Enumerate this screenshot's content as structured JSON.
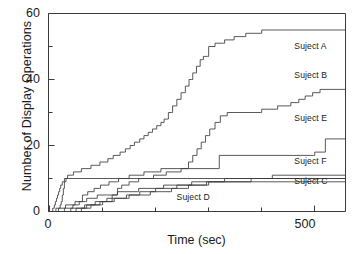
{
  "chart_data": {
    "type": "line",
    "title": "",
    "xlabel": "Time (sec)",
    "ylabel": "Number of Display Operations",
    "xlim": [
      0,
      560
    ],
    "ylim": [
      0,
      60
    ],
    "xticks": [
      0,
      500
    ],
    "xticklabels": [
      "0",
      "500"
    ],
    "xminorticks": [
      100,
      200,
      300,
      400
    ],
    "yticks": [
      0,
      20,
      40,
      60
    ],
    "yticklabels": [
      "0",
      "20",
      "40",
      "60"
    ],
    "yminorticks": [
      10,
      30,
      50
    ],
    "grid": false,
    "legend_position": "inline-right",
    "style": "step-post",
    "line_color": "#3b3b3b",
    "series": [
      {
        "name": "Suject A",
        "label_x": 505,
        "label_y": 50,
        "points": [
          [
            0,
            0
          ],
          [
            18,
            0
          ],
          [
            19,
            1
          ],
          [
            22,
            2
          ],
          [
            24,
            3
          ],
          [
            26,
            5
          ],
          [
            28,
            7
          ],
          [
            30,
            9
          ],
          [
            33,
            10
          ],
          [
            36,
            11
          ],
          [
            45,
            11
          ],
          [
            47,
            12
          ],
          [
            60,
            12
          ],
          [
            62,
            13
          ],
          [
            78,
            13
          ],
          [
            80,
            14
          ],
          [
            95,
            14
          ],
          [
            97,
            15
          ],
          [
            110,
            15
          ],
          [
            112,
            16
          ],
          [
            120,
            16
          ],
          [
            122,
            17
          ],
          [
            133,
            17
          ],
          [
            135,
            18
          ],
          [
            143,
            18
          ],
          [
            145,
            19
          ],
          [
            152,
            19
          ],
          [
            154,
            20
          ],
          [
            160,
            20
          ],
          [
            162,
            21
          ],
          [
            170,
            21
          ],
          [
            172,
            22
          ],
          [
            178,
            22
          ],
          [
            180,
            23
          ],
          [
            186,
            23
          ],
          [
            188,
            24
          ],
          [
            194,
            24
          ],
          [
            196,
            25
          ],
          [
            202,
            25
          ],
          [
            204,
            26
          ],
          [
            210,
            26
          ],
          [
            212,
            27
          ],
          [
            216,
            27
          ],
          [
            218,
            28
          ],
          [
            224,
            28
          ],
          [
            226,
            30
          ],
          [
            232,
            30
          ],
          [
            234,
            32
          ],
          [
            240,
            32
          ],
          [
            242,
            34
          ],
          [
            248,
            34
          ],
          [
            250,
            36
          ],
          [
            256,
            36
          ],
          [
            258,
            38
          ],
          [
            263,
            38
          ],
          [
            265,
            40
          ],
          [
            270,
            40
          ],
          [
            272,
            42
          ],
          [
            277,
            42
          ],
          [
            279,
            44
          ],
          [
            284,
            44
          ],
          [
            286,
            46
          ],
          [
            290,
            46
          ],
          [
            292,
            47
          ],
          [
            300,
            47
          ],
          [
            302,
            50
          ],
          [
            312,
            50
          ],
          [
            314,
            51
          ],
          [
            330,
            51
          ],
          [
            332,
            52
          ],
          [
            348,
            52
          ],
          [
            350,
            53
          ],
          [
            370,
            53
          ],
          [
            372,
            54
          ],
          [
            400,
            54
          ],
          [
            402,
            55
          ],
          [
            560,
            55
          ]
        ]
      },
      {
        "name": "Suject B",
        "label_x": 505,
        "label_y": 41,
        "points": [
          [
            0,
            0
          ],
          [
            40,
            0
          ],
          [
            42,
            1
          ],
          [
            70,
            1
          ],
          [
            72,
            2
          ],
          [
            95,
            2
          ],
          [
            97,
            3
          ],
          [
            118,
            3
          ],
          [
            120,
            5
          ],
          [
            128,
            5
          ],
          [
            130,
            7
          ],
          [
            136,
            7
          ],
          [
            138,
            8
          ],
          [
            150,
            8
          ],
          [
            152,
            9
          ],
          [
            168,
            9
          ],
          [
            170,
            10
          ],
          [
            196,
            10
          ],
          [
            198,
            11
          ],
          [
            220,
            11
          ],
          [
            222,
            12
          ],
          [
            248,
            12
          ],
          [
            250,
            13
          ],
          [
            262,
            13
          ],
          [
            264,
            15
          ],
          [
            270,
            15
          ],
          [
            272,
            17
          ],
          [
            278,
            17
          ],
          [
            280,
            19
          ],
          [
            286,
            19
          ],
          [
            288,
            21
          ],
          [
            294,
            21
          ],
          [
            296,
            23
          ],
          [
            302,
            23
          ],
          [
            304,
            25
          ],
          [
            312,
            25
          ],
          [
            314,
            27
          ],
          [
            322,
            27
          ],
          [
            324,
            29
          ],
          [
            335,
            29
          ],
          [
            337,
            30
          ],
          [
            400,
            30
          ],
          [
            402,
            31
          ],
          [
            430,
            31
          ],
          [
            432,
            32
          ],
          [
            455,
            32
          ],
          [
            457,
            33
          ],
          [
            470,
            33
          ],
          [
            472,
            34
          ],
          [
            482,
            34
          ],
          [
            484,
            35
          ],
          [
            496,
            35
          ],
          [
            498,
            36
          ],
          [
            510,
            36
          ],
          [
            512,
            37
          ],
          [
            560,
            37
          ]
        ]
      },
      {
        "name": "Suject E",
        "label_x": 505,
        "label_y": 28,
        "points": [
          [
            0,
            0
          ],
          [
            12,
            0
          ],
          [
            14,
            1
          ],
          [
            30,
            1
          ],
          [
            32,
            2
          ],
          [
            48,
            2
          ],
          [
            50,
            3
          ],
          [
            62,
            3
          ],
          [
            64,
            5
          ],
          [
            72,
            5
          ],
          [
            74,
            6
          ],
          [
            84,
            6
          ],
          [
            86,
            7
          ],
          [
            96,
            7
          ],
          [
            98,
            8
          ],
          [
            112,
            8
          ],
          [
            114,
            9
          ],
          [
            130,
            9
          ],
          [
            132,
            10
          ],
          [
            150,
            10
          ],
          [
            152,
            11
          ],
          [
            178,
            11
          ],
          [
            180,
            12
          ],
          [
            210,
            12
          ],
          [
            212,
            13
          ],
          [
            320,
            13
          ],
          [
            322,
            17
          ],
          [
            500,
            17
          ],
          [
            502,
            18
          ],
          [
            520,
            18
          ],
          [
            522,
            22
          ],
          [
            560,
            22
          ]
        ]
      },
      {
        "name": "Suject F",
        "label_x": 505,
        "label_y": 15,
        "points": [
          [
            0,
            0
          ],
          [
            6,
            0
          ],
          [
            8,
            1
          ],
          [
            11,
            2
          ],
          [
            13,
            3
          ],
          [
            15,
            4
          ],
          [
            17,
            5
          ],
          [
            19,
            6
          ],
          [
            21,
            7
          ],
          [
            23,
            8
          ],
          [
            26,
            9
          ],
          [
            30,
            10
          ],
          [
            248,
            10
          ],
          [
            560,
            10
          ]
        ]
      },
      {
        "name": "Suject C",
        "label_x": 505,
        "label_y": 9,
        "points": [
          [
            0,
            0
          ],
          [
            60,
            0
          ],
          [
            62,
            1
          ],
          [
            78,
            1
          ],
          [
            80,
            2
          ],
          [
            100,
            2
          ],
          [
            102,
            3
          ],
          [
            122,
            3
          ],
          [
            124,
            4
          ],
          [
            145,
            4
          ],
          [
            147,
            5
          ],
          [
            170,
            5
          ],
          [
            172,
            6
          ],
          [
            200,
            6
          ],
          [
            202,
            7
          ],
          [
            240,
            7
          ],
          [
            242,
            8
          ],
          [
            300,
            8
          ],
          [
            302,
            9
          ],
          [
            380,
            9
          ],
          [
            382,
            10
          ],
          [
            420,
            10
          ],
          [
            422,
            11
          ],
          [
            560,
            11
          ]
        ]
      },
      {
        "name": "Suject D",
        "label_x": 283,
        "label_y": 4,
        "points": [
          [
            0,
            0
          ],
          [
            28,
            0
          ],
          [
            30,
            1
          ],
          [
            44,
            1
          ],
          [
            46,
            2
          ],
          [
            56,
            2
          ],
          [
            58,
            3
          ],
          [
            70,
            3
          ],
          [
            72,
            4
          ],
          [
            90,
            4
          ],
          [
            92,
            5
          ],
          [
            128,
            5
          ],
          [
            130,
            6
          ],
          [
            168,
            6
          ],
          [
            170,
            7
          ],
          [
            215,
            7
          ],
          [
            217,
            8
          ],
          [
            268,
            8
          ],
          [
            270,
            9
          ],
          [
            330,
            9
          ],
          [
            332,
            10
          ],
          [
            560,
            10
          ]
        ]
      }
    ],
    "extra_series": [
      {
        "name": "low-d2",
        "points": [
          [
            0,
            0
          ],
          [
            50,
            0
          ],
          [
            52,
            1
          ],
          [
            66,
            1
          ],
          [
            68,
            2
          ],
          [
            86,
            2
          ],
          [
            88,
            3
          ],
          [
            108,
            3
          ],
          [
            110,
            4
          ],
          [
            150,
            4
          ],
          [
            152,
            5
          ],
          [
            190,
            5
          ],
          [
            192,
            6
          ],
          [
            230,
            6
          ],
          [
            232,
            7
          ],
          [
            262,
            7
          ],
          [
            264,
            8
          ],
          [
            296,
            8
          ],
          [
            298,
            9
          ],
          [
            560,
            9
          ]
        ]
      }
    ]
  }
}
